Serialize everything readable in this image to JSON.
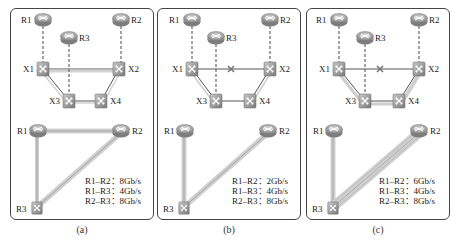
{
  "figure": {
    "panels": [
      {
        "id": "a",
        "caption": "(a)",
        "failed_link": null,
        "physical": {
          "routers": [
            {
              "name": "R1",
              "label": "R1"
            },
            {
              "name": "R2",
              "label": "R2"
            },
            {
              "name": "R3",
              "label": "R3"
            }
          ],
          "switches": [
            {
              "name": "X1",
              "label": "X1"
            },
            {
              "name": "X2",
              "label": "X2"
            },
            {
              "name": "X3",
              "label": "X3"
            },
            {
              "name": "X4",
              "label": "X4"
            }
          ],
          "links": [
            "R1-X1",
            "R2-X2",
            "R3-X3",
            "X1-X2",
            "X1-X3",
            "X2-X4",
            "X3-X4"
          ]
        },
        "logical": {
          "nodes": [
            "R1",
            "R2",
            "R3"
          ],
          "rates": [
            {
              "pair": "R1–R2",
              "sep": "：",
              "value": "8Gb/s"
            },
            {
              "pair": "R1–R3",
              "sep": "：",
              "value": "4Gb/s"
            },
            {
              "pair": "R2–R3",
              "sep": "：",
              "value": "8Gb/s"
            }
          ],
          "rate_lines": [
            "R1–R2：8Gb/s",
            "R1–R3：4Gb/s",
            "R2–R3：8Gb/s"
          ]
        }
      },
      {
        "id": "b",
        "caption": "(b)",
        "failed_link": "X1-X2",
        "physical": {
          "routers": [
            {
              "name": "R1",
              "label": "R1"
            },
            {
              "name": "R2",
              "label": "R2"
            },
            {
              "name": "R3",
              "label": "R3"
            }
          ],
          "switches": [
            {
              "name": "X1",
              "label": "X1"
            },
            {
              "name": "X2",
              "label": "X2"
            },
            {
              "name": "X3",
              "label": "X3"
            },
            {
              "name": "X4",
              "label": "X4"
            }
          ],
          "links": [
            "R1-X1",
            "R2-X2",
            "R3-X3",
            "X1-X2",
            "X1-X3",
            "X2-X4",
            "X3-X4"
          ]
        },
        "logical": {
          "nodes": [
            "R1",
            "R2",
            "R3"
          ],
          "rate_lines": [
            "R1–R2：2Gb/s",
            "R1–R3：4Gb/s",
            "R2–R3：8Gb/s"
          ]
        }
      },
      {
        "id": "c",
        "caption": "(c)",
        "failed_link": "X1-X2",
        "physical": {
          "routers": [
            {
              "name": "R1",
              "label": "R1"
            },
            {
              "name": "R2",
              "label": "R2"
            },
            {
              "name": "R3",
              "label": "R3"
            }
          ],
          "switches": [
            {
              "name": "X1",
              "label": "X1"
            },
            {
              "name": "X2",
              "label": "X2"
            },
            {
              "name": "X3",
              "label": "X3"
            },
            {
              "name": "X4",
              "label": "X4"
            }
          ],
          "links": [
            "R1-X1",
            "R2-X2",
            "R3-X3",
            "X1-X2",
            "X1-X3",
            "X2-X4",
            "X3-X4"
          ]
        },
        "logical": {
          "nodes": [
            "R1",
            "R2",
            "R3"
          ],
          "rate_lines": [
            "R1–R2：6Gb/s",
            "R1–R3：4Gb/s",
            "R2–R3：8Gb/s"
          ]
        }
      }
    ],
    "colors": {
      "border": "#444444",
      "router": "#9a9a9a",
      "switch": "#8c8c8c",
      "link": "#555555",
      "band": "#d9d9d9",
      "failure_mark": "#777777"
    }
  }
}
